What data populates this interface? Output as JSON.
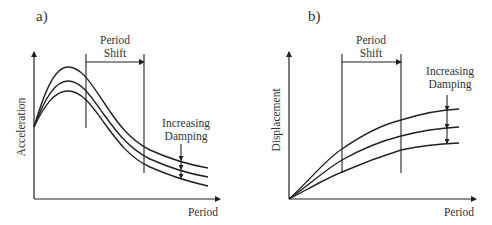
{
  "panels": [
    {
      "label": "a)",
      "ylabel": "Acceleration",
      "xlabel": "Period",
      "shift_label_1": "Period",
      "shift_label_2": "Shift",
      "damping_label_1": "Increasing",
      "damping_label_2": "Damping"
    },
    {
      "label": "b)",
      "ylabel": "Displacement",
      "xlabel": "Period",
      "shift_label_1": "Period",
      "shift_label_2": "Shift",
      "damping_label_1": "Increasing",
      "damping_label_2": "Damping"
    }
  ],
  "colors": {
    "line": "#222222",
    "text": "#333333",
    "background": "#ffffff"
  }
}
